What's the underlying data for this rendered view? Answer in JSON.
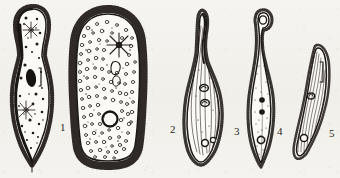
{
  "figure": {
    "kind": "scientific-line-drawing-plate",
    "medium": "scanned ink illustration",
    "background_color": "#f4f2ee",
    "ink_color": "#241f1c",
    "specimen_count": 5,
    "caption": ""
  },
  "labels": {
    "one": "1",
    "two": "2",
    "three": "3",
    "four": "4",
    "five": "5"
  },
  "specimens": [
    {
      "number": "1",
      "name": "specimen-1",
      "shape": "elongated pear / club shaped, narrow anterior, broad rounded posterior with pointed tail",
      "surface": "dense short cilia fringe all around, heavy dark outline on left margin",
      "features": [
        "star-shaped contractile vacuole, anterior third",
        "star-shaped contractile vacuole, posterior third",
        "dark elongate macronucleus near mid-body",
        "narrow oral groove slit right of macronucleus",
        "scattered dark cytoplasmic granules throughout",
        "short caudal bristle at posterior tip"
      ],
      "label_position": {
        "x": 60,
        "y": 122
      }
    },
    {
      "number": "2",
      "name": "specimen-2",
      "shape": "large broad ovoid / rounded rectangular, widest of the series",
      "surface": "long coarse cilia projecting radially from entire perimeter",
      "features": [
        "star-shaped contractile vacuole, anterior region",
        "large bold circular contractile vacuole, posterior region",
        "cytoplasm densely packed with small ring-like food vacuoles",
        "curved macronucleus below anterior star"
      ],
      "label_position": {
        "x": 170,
        "y": 124
      }
    },
    {
      "number": "3",
      "name": "specimen-3",
      "shape": "slender spindle / teardrop, drawn-out curved anterior neck, tapering posterior",
      "surface": "fine cilia along margins, longitudinal striations over body",
      "features": [
        "two ring-shaped nuclei stacked mid-body",
        "small circular vacuole near posterior end",
        "longitudinal kineties running the length of the cell"
      ],
      "label_position": {
        "x": 234,
        "y": 126
      }
    },
    {
      "number": "4",
      "name": "specimen-4",
      "shape": "very slender elongate fusiform with hooked anterior tip",
      "surface": "short cilia along both margins, lightly stippled cytoplasm",
      "features": [
        "hooked/looped anterior end",
        "two solid dark nuclei mid-body",
        "open circular contractile vacuole near posterior",
        "pointed posterior tip"
      ],
      "label_position": {
        "x": 277,
        "y": 126
      }
    },
    {
      "number": "5",
      "name": "specimen-5",
      "shape": "small curved crescent / leaf shaped, smallest of the series",
      "surface": "fine longitudinal striations, sparse marginal cilia",
      "features": [
        "small ring nucleus above mid-body",
        "circular vacuole at posterior end",
        "narrow slit-like oral structure upper right"
      ],
      "label_position": {
        "x": 329,
        "y": 128
      }
    }
  ]
}
